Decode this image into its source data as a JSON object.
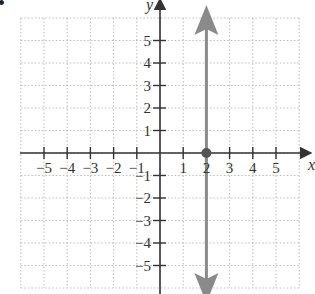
{
  "problem_marker": "•",
  "chart_data": {
    "type": "line",
    "title": "",
    "xlabel": "x",
    "ylabel": "y",
    "xlim": [
      -6,
      6
    ],
    "ylim": [
      -6,
      6
    ],
    "grid": true,
    "grid_style": "dotted",
    "x_ticks": [
      -5,
      -4,
      -3,
      -2,
      -1,
      1,
      2,
      3,
      4,
      5
    ],
    "y_ticks": [
      5,
      4,
      3,
      2,
      1,
      -1,
      -2,
      -3,
      -4,
      -5
    ],
    "x_tick_labels": [
      "−5",
      "−4",
      "−3",
      "−2",
      "−1",
      "1",
      "2",
      "3",
      "4",
      "5"
    ],
    "y_tick_labels": [
      "5",
      "4",
      "3",
      "2",
      "1",
      "−1",
      "−2",
      "−3",
      "−4",
      "−5"
    ],
    "series": [
      {
        "name": "x = 2",
        "kind": "vertical-line",
        "x": 2,
        "arrows": "both",
        "color": "#8a8a8a"
      }
    ],
    "points": [
      {
        "x": 2,
        "y": 0,
        "label": "x-intercept",
        "color": "#555555"
      }
    ]
  },
  "colors": {
    "axis": "#333333",
    "grid": "#bbbbbb",
    "line": "#8a8a8a",
    "point": "#555555"
  }
}
